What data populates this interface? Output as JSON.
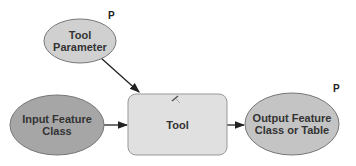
{
  "diagram": {
    "nodes": [
      {
        "id": "tool-parameter",
        "label": "Tool Parameter",
        "shape": "ellipse",
        "fill": "#d0d0d0",
        "badge": "P"
      },
      {
        "id": "input-feature-class",
        "label": "Input Feature Class",
        "shape": "ellipse",
        "fill": "#a6a6a6"
      },
      {
        "id": "tool",
        "label": "Tool",
        "shape": "rounded-rect",
        "fill": "#e0e0e0",
        "icon": "hammer-icon"
      },
      {
        "id": "output",
        "label": "Output Feature Class or Table",
        "shape": "ellipse",
        "fill": "#c4c4c4",
        "badge": "P"
      }
    ],
    "edges": [
      {
        "from": "tool-parameter",
        "to": "tool"
      },
      {
        "from": "input-feature-class",
        "to": "tool"
      },
      {
        "from": "tool",
        "to": "output"
      }
    ]
  }
}
